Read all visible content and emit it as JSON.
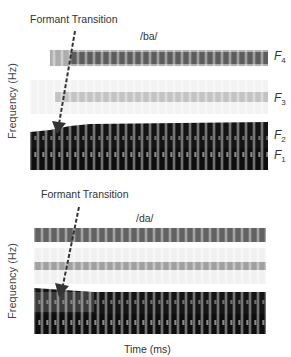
{
  "figure": {
    "top_panel": {
      "syllable": "/ba/",
      "annotation": "Formant Transition",
      "y_axis_label": "Frequency (Hz)",
      "formant_labels": [
        {
          "name": "F",
          "sub": "4"
        },
        {
          "name": "F",
          "sub": "3"
        },
        {
          "name": "F",
          "sub": "2"
        },
        {
          "name": "F",
          "sub": "1"
        }
      ]
    },
    "bottom_panel": {
      "syllable": "/da/",
      "annotation": "Formant Transition",
      "y_axis_label": "Frequency (Hz)",
      "x_axis_label": "Time (ms)"
    },
    "colors": {
      "band_dark": "#111111",
      "band_mid": "#555555",
      "band_light": "#9a9a9a",
      "background": "#ffffff",
      "text": "#333333"
    }
  }
}
